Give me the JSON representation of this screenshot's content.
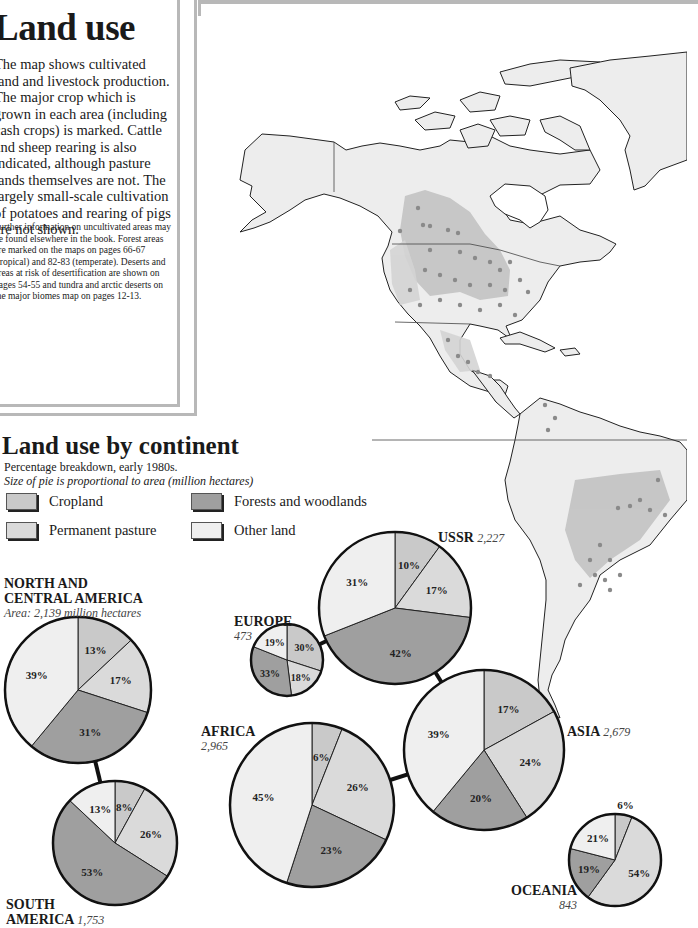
{
  "intro_box": {
    "title": "Land use",
    "body": "The map shows cultivated land and livestock production. The major crop which is grown in each area (including cash crops) is marked. Cattle and sheep rearing is also indicated, although pasture lands themselves are not. The largely small-scale cultivation of potatoes and rearing of pigs are not shown.",
    "note": "Further information on uncultivated areas may be found elsewhere in the book. Forest areas are marked on the maps on pages 66-67 (tropical) and 82-83 (temperate). Deserts and areas at risk of desertification are shown on pages 54-55 and tundra and arctic deserts on the major biomes map on pages 12-13."
  },
  "map": {
    "region": "North, Central and South America",
    "colors": {
      "land": "#ededed",
      "pasture_zone": "#d6d6d6",
      "crop_zone": "#bdbdbd",
      "dot": "#888888",
      "coast": "#222222"
    }
  },
  "chart_header": {
    "title": "Land use by continent",
    "subtitle": "Percentage breakdown, early 1980s.",
    "subtitle2": "Size of pie is proportional to area (million hectares)"
  },
  "legend": [
    {
      "label": "Cropland",
      "color": "#c9c9c9"
    },
    {
      "label": "Forests and woodlands",
      "color": "#9f9f9f"
    },
    {
      "label": "Permanent pasture",
      "color": "#dadada"
    },
    {
      "label": "Other land",
      "color": "#efefef"
    }
  ],
  "pies": [
    {
      "name": "NORTH AND CENTRAL AMERICA",
      "line1": "NORTH AND",
      "line2": "CENTRAL AMERICA",
      "area_text": "Area: 2,139 million hectares",
      "area": 2139
    },
    {
      "name": "SOUTH AMERICA",
      "line1": "SOUTH",
      "line2": "AMERICA",
      "area_text": "1,753",
      "area": 1753
    },
    {
      "name": "EUROPE",
      "line1": "EUROPE",
      "area_text": "473",
      "area": 473
    },
    {
      "name": "USSR",
      "line1": "USSR",
      "area_text": "2,227",
      "area": 2227
    },
    {
      "name": "AFRICA",
      "line1": "AFRICA",
      "area_text": "2,965",
      "area": 2965
    },
    {
      "name": "ASIA",
      "line1": "ASIA",
      "area_text": "2,679",
      "area": 2679
    },
    {
      "name": "OCEANIA",
      "line1": "OCEANIA",
      "area_text": "843",
      "area": 843
    }
  ],
  "chart_data": {
    "type": "pie",
    "title": "Land use by continent",
    "subtitle": "Percentage breakdown, early 1980s. Size of pie is proportional to area (million hectares)",
    "categories": [
      "Cropland",
      "Permanent pasture",
      "Forests and woodlands",
      "Other land"
    ],
    "colors": [
      "#c9c9c9",
      "#dadada",
      "#9f9f9f",
      "#efefef"
    ],
    "series": [
      {
        "name": "North and Central America",
        "area_million_ha": 2139,
        "values": [
          13,
          17,
          31,
          39
        ]
      },
      {
        "name": "South America",
        "area_million_ha": 1753,
        "values": [
          8,
          26,
          53,
          13
        ]
      },
      {
        "name": "Europe",
        "area_million_ha": 473,
        "values": [
          30,
          18,
          33,
          19
        ]
      },
      {
        "name": "USSR",
        "area_million_ha": 2227,
        "values": [
          10,
          17,
          42,
          31
        ]
      },
      {
        "name": "Africa",
        "area_million_ha": 2965,
        "values": [
          6,
          26,
          23,
          45
        ]
      },
      {
        "name": "Asia",
        "area_million_ha": 2679,
        "values": [
          17,
          24,
          20,
          39
        ]
      },
      {
        "name": "Oceania",
        "area_million_ha": 843,
        "values": [
          6,
          54,
          19,
          21
        ]
      }
    ],
    "legend_position": "top-left"
  }
}
